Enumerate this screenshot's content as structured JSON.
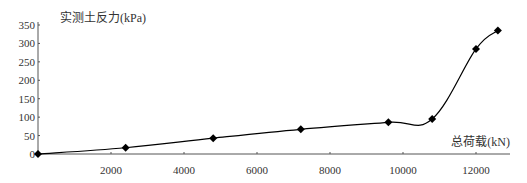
{
  "chart_data": {
    "type": "line",
    "title": "",
    "xlabel": "总荷载(kN)",
    "ylabel": "实测土反力(kPa)",
    "xlim": [
      0,
      13000
    ],
    "ylim": [
      0,
      350
    ],
    "xticks": [
      2000,
      4000,
      6000,
      8000,
      10000,
      12000
    ],
    "yticks": [
      0,
      50,
      100,
      150,
      200,
      250,
      300,
      350
    ],
    "grid": false,
    "legend": null,
    "series": [
      {
        "name": "实测土反力",
        "marker": "diamond",
        "color": "#000000",
        "x": [
          0,
          2400,
          4800,
          7200,
          9600,
          10800,
          12000,
          12600
        ],
        "y": [
          0,
          17,
          43,
          67,
          86,
          95,
          285,
          335
        ]
      }
    ]
  },
  "labels": {
    "x_axis_title": "总荷载(kN)",
    "y_axis_title": "实测土反力(kPa)",
    "x_ticks": [
      "2000",
      "4000",
      "6000",
      "8000",
      "10000",
      "12000"
    ],
    "y_ticks": [
      "0",
      "50",
      "100",
      "150",
      "200",
      "250",
      "300",
      "350"
    ]
  }
}
